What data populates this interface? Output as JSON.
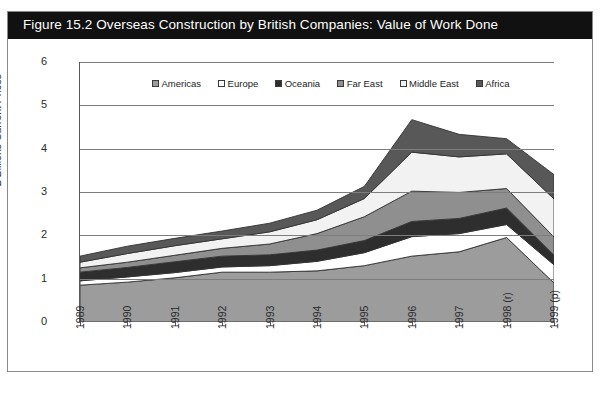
{
  "figure": {
    "title": "Figure 15.2  Overseas Construction by British Companies: Value of Work Done",
    "banner_color": "#111111",
    "background": "#ffffff"
  },
  "legend": {
    "position": "top-inside",
    "items": [
      {
        "label": "Americas",
        "color": "#9c9c9c",
        "swatch": "mid-gray"
      },
      {
        "label": "Europe",
        "color": "#ffffff",
        "swatch": "white"
      },
      {
        "label": "Oceania",
        "color": "#2e2e2e",
        "swatch": "near-black"
      },
      {
        "label": "Far East",
        "color": "#8f8f8f",
        "swatch": "gray"
      },
      {
        "label": "Middle East",
        "color": "#f2f2f2",
        "swatch": "light-gray"
      },
      {
        "label": "Africa",
        "color": "#585858",
        "swatch": "dark-gray"
      }
    ]
  },
  "axes": {
    "ylabel": "£ Billions Current Prices",
    "yticks": [
      "0",
      "1",
      "2",
      "3",
      "4",
      "5",
      "6"
    ],
    "ylim": [
      0,
      6
    ],
    "xticks": [
      "1989",
      "1990",
      "1991",
      "1992",
      "1993",
      "1994",
      "1995",
      "1996",
      "1997",
      "1998 (r)",
      "1999 (p)"
    ],
    "grid": "horizontal"
  },
  "chart_data": {
    "type": "area",
    "title": "Figure 15.2  Overseas Construction by British Companies: Value of Work Done",
    "xlabel": "",
    "ylabel": "£ Billions Current Prices",
    "ylim": [
      0,
      6
    ],
    "grid": true,
    "legend_position": "top-inside",
    "stacked": true,
    "categories": [
      "1989",
      "1990",
      "1991",
      "1992",
      "1993",
      "1994",
      "1995",
      "1996",
      "1997",
      "1998 (r)",
      "1999 (p)"
    ],
    "series": [
      {
        "name": "Americas",
        "color": "#9c9c9c",
        "values": [
          0.85,
          0.92,
          1.02,
          1.15,
          1.15,
          1.18,
          1.3,
          1.52,
          1.62,
          1.95,
          0.9
        ]
      },
      {
        "name": "Europe",
        "color": "#ffffff",
        "values": [
          0.1,
          0.12,
          0.12,
          0.12,
          0.15,
          0.22,
          0.3,
          0.45,
          0.42,
          0.3,
          0.42
        ]
      },
      {
        "name": "Oceania",
        "color": "#2e2e2e",
        "values": [
          0.2,
          0.22,
          0.25,
          0.25,
          0.25,
          0.26,
          0.28,
          0.35,
          0.35,
          0.38,
          0.22
        ]
      },
      {
        "name": "Far East",
        "color": "#8f8f8f",
        "values": [
          0.1,
          0.12,
          0.15,
          0.18,
          0.25,
          0.38,
          0.55,
          0.7,
          0.6,
          0.45,
          0.42
        ]
      },
      {
        "name": "Middle East",
        "color": "#f2f2f2",
        "values": [
          0.13,
          0.2,
          0.22,
          0.22,
          0.28,
          0.32,
          0.42,
          0.9,
          0.82,
          0.8,
          0.88
        ]
      },
      {
        "name": "Africa",
        "color": "#585858",
        "values": [
          0.14,
          0.17,
          0.17,
          0.18,
          0.2,
          0.22,
          0.28,
          0.75,
          0.52,
          0.35,
          0.56
        ]
      }
    ],
    "totals": [
      1.52,
      1.75,
      1.93,
      2.1,
      2.28,
      2.58,
      3.13,
      4.67,
      4.33,
      4.23,
      3.4
    ]
  }
}
